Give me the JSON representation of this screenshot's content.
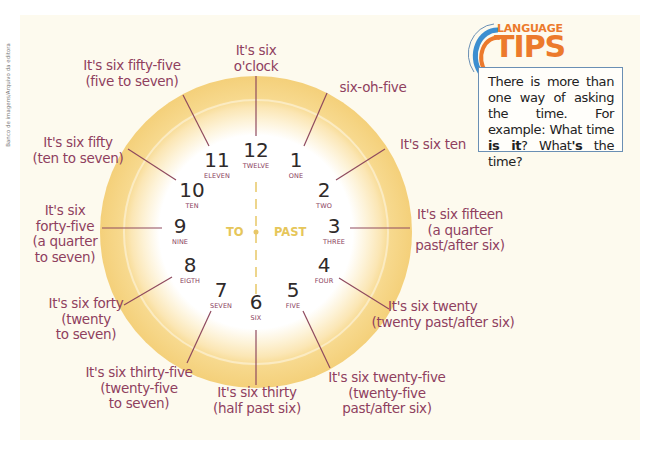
{
  "credit": "Banco de imagens/Arquivo da editora",
  "tips": {
    "logo_top": "LANGUAGE",
    "logo_main": "TIPS",
    "text_1": "There is more than one way of asking the time. For example: What time ",
    "bold_1": "is it",
    "text_2": "? What",
    "bold_2": "'s",
    "text_3": " the time?"
  },
  "clock": {
    "center_left": "TO",
    "center_right": "PAST",
    "hours": [
      {
        "num": "12",
        "word": "TWELVE"
      },
      {
        "num": "1",
        "word": "ONE"
      },
      {
        "num": "2",
        "word": "TWO"
      },
      {
        "num": "3",
        "word": "THREE"
      },
      {
        "num": "4",
        "word": "FOUR"
      },
      {
        "num": "5",
        "word": "FIVE"
      },
      {
        "num": "6",
        "word": "SIX"
      },
      {
        "num": "7",
        "word": "SEVEN"
      },
      {
        "num": "8",
        "word": "EIGTH"
      },
      {
        "num": "9",
        "word": "NINE"
      },
      {
        "num": "10",
        "word": "TEN"
      },
      {
        "num": "11",
        "word": "ELEVEN"
      }
    ]
  },
  "labels": {
    "h12": [
      "It's six",
      "o'clock"
    ],
    "h1": [
      "six-oh-five"
    ],
    "h2": [
      "It's six ten"
    ],
    "h3": [
      "It's six fifteen",
      "(a quarter",
      "past/after six)"
    ],
    "h4": [
      "It's six twenty",
      "(twenty past/after six)"
    ],
    "h5": [
      "It's six twenty-five",
      "(twenty-five",
      "past/after six)"
    ],
    "h6": [
      "It's six thirty",
      "(half past six)"
    ],
    "h7": [
      "It's six thirty-five",
      "(twenty-five",
      "to seven)"
    ],
    "h8": [
      "It's six forty",
      "(twenty",
      "to seven)"
    ],
    "h9": [
      "It's six",
      "forty-five",
      "(a quarter",
      "to seven)"
    ],
    "h10": [
      "It's six fifty",
      "(ten to seven)"
    ],
    "h11": [
      "It's six fifty-five",
      "(five to seven)"
    ]
  },
  "colors": {
    "label": "#8f3f5e",
    "ring": "#f5d58a",
    "accent_orange": "#ec7a2c",
    "box_border": "#6a8fb4",
    "to_past": "#e6c65a"
  }
}
